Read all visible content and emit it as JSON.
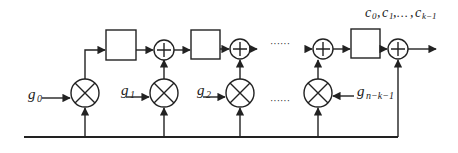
{
  "diagram": {
    "type": "block-diagram",
    "labels": {
      "output": "c₀, c₁, …, cₖ₋₁",
      "output_main": "c",
      "g0_main": "g",
      "g0_sub": "0",
      "g1_main": "g",
      "g1_sub": "1",
      "g2_main": "g",
      "g2_sub": "2",
      "gn_main": "g",
      "gn_sub": "n−k−1",
      "ellipsis_top": "······",
      "ellipsis_bottom": "······"
    },
    "output_parts": [
      {
        "main": "c",
        "sub": "0"
      },
      {
        "main": "c",
        "sub": "1"
      },
      {
        "main": "…",
        "sub": ""
      },
      {
        "main": "c",
        "sub": "k−1"
      }
    ],
    "nodes": {
      "multipliers": [
        "g0",
        "g1",
        "g2",
        "g(n-k-1)"
      ],
      "adders": 4,
      "registers": 3
    },
    "icons": {
      "multiplier": "circled-times-icon",
      "adder": "circled-plus-icon",
      "register": "square-box-icon",
      "arrow": "arrowhead-icon"
    },
    "colors": {
      "stroke": "#222222",
      "background": "#ffffff"
    }
  }
}
